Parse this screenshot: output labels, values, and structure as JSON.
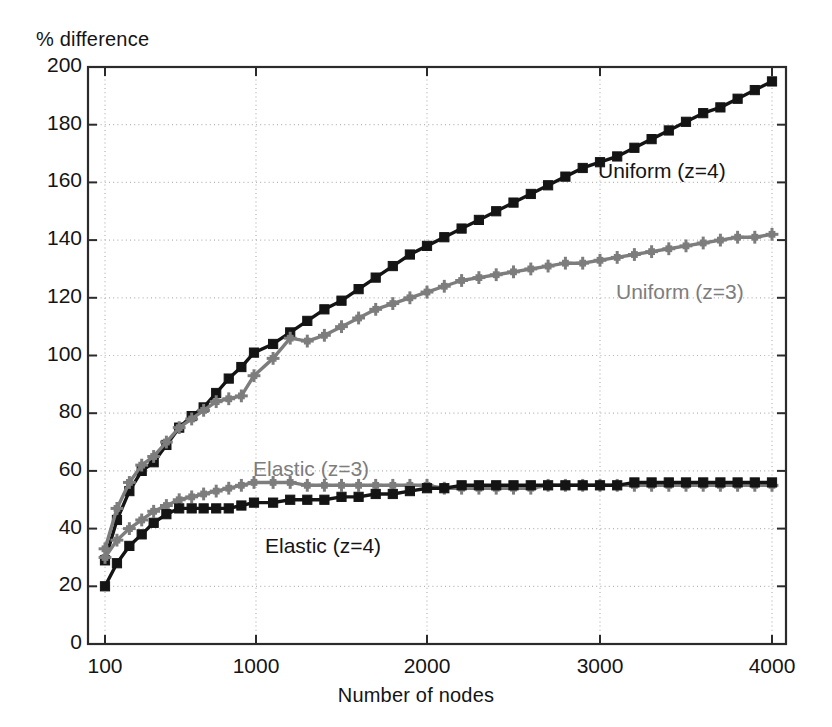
{
  "chart_data": {
    "type": "line",
    "title": "",
    "xlabel": "Number of nodes",
    "ylabel": "% difference",
    "xscale": "log-like",
    "xlim": [
      100,
      4000
    ],
    "ylim": [
      0,
      200
    ],
    "grid": true,
    "legend_position": "inline-annotations",
    "xticks": [
      100,
      1000,
      2000,
      3000,
      4000
    ],
    "xtick_labels": [
      "100",
      "1000",
      "2000",
      "3000",
      "4000"
    ],
    "yticks": [
      0,
      20,
      40,
      60,
      80,
      100,
      120,
      140,
      160,
      180,
      200
    ],
    "ytick_labels": [
      "0",
      "20",
      "40",
      "60",
      "80",
      "100",
      "120",
      "140",
      "160",
      "180",
      "200"
    ],
    "colors": {
      "black": "#141414",
      "gray": "#7d7d7d",
      "grid": "#b4b4b4",
      "axis": "#2b2b2b",
      "background": "#ffffff"
    },
    "series": [
      {
        "name": "Uniform (z=4)",
        "color": "#141414",
        "marker": "square",
        "x": [
          100,
          120,
          145,
          175,
          210,
          255,
          310,
          375,
          450,
          545,
          660,
          800,
          970,
          1100,
          1200,
          1300,
          1400,
          1500,
          1600,
          1700,
          1800,
          1900,
          2000,
          2100,
          2200,
          2300,
          2400,
          2500,
          2600,
          2700,
          2800,
          2900,
          3000,
          3100,
          3200,
          3300,
          3400,
          3500,
          3600,
          3700,
          3800,
          3900,
          4000
        ],
        "y": [
          29,
          43,
          53,
          60,
          63,
          69,
          75,
          79,
          82,
          87,
          92,
          96,
          101,
          104,
          108,
          112,
          116,
          119,
          123,
          127,
          131,
          135,
          138,
          141,
          144,
          147,
          150,
          153,
          156,
          159,
          162,
          165,
          167,
          169,
          172,
          175,
          178,
          181,
          184,
          186,
          189,
          192,
          195
        ]
      },
      {
        "name": "Uniform (z=3)",
        "color": "#7d7d7d",
        "marker": "plus-square",
        "x": [
          100,
          120,
          145,
          175,
          210,
          255,
          310,
          375,
          450,
          545,
          660,
          800,
          970,
          1100,
          1200,
          1300,
          1400,
          1500,
          1600,
          1700,
          1800,
          1900,
          2000,
          2100,
          2200,
          2300,
          2400,
          2500,
          2600,
          2700,
          2800,
          2900,
          3000,
          3100,
          3200,
          3300,
          3400,
          3500,
          3600,
          3700,
          3800,
          3900,
          4000
        ],
        "y": [
          33,
          47,
          56,
          62,
          65,
          70,
          75,
          78,
          81,
          84,
          85,
          86,
          93,
          99,
          106,
          105,
          107,
          110,
          113,
          116,
          118,
          120,
          122,
          124,
          126,
          127,
          128,
          129,
          130,
          131,
          132,
          132,
          133,
          134,
          135,
          136,
          137,
          138,
          139,
          140,
          141,
          141,
          142
        ]
      },
      {
        "name": "Elastic (z=3)",
        "color": "#7d7d7d",
        "marker": "plus-square",
        "x": [
          100,
          120,
          145,
          175,
          210,
          255,
          310,
          375,
          450,
          545,
          660,
          800,
          970,
          1100,
          1200,
          1300,
          1400,
          1500,
          1600,
          1700,
          1800,
          1900,
          2000,
          2100,
          2200,
          2300,
          2400,
          2500,
          2600,
          2700,
          2800,
          2900,
          3000,
          3100,
          3200,
          3300,
          3400,
          3500,
          3600,
          3700,
          3800,
          3900,
          4000
        ],
        "y": [
          30,
          36,
          40,
          43,
          46,
          48,
          50,
          51,
          52,
          53,
          54,
          55,
          56,
          56,
          56,
          55,
          55,
          55,
          55,
          55,
          55,
          55,
          55,
          54,
          54,
          54,
          54,
          54,
          54,
          55,
          55,
          55,
          55,
          55,
          55,
          55,
          55,
          55,
          55,
          55,
          55,
          55,
          55
        ]
      },
      {
        "name": "Elastic (z=4)",
        "color": "#141414",
        "marker": "square",
        "x": [
          100,
          120,
          145,
          175,
          210,
          255,
          310,
          375,
          450,
          545,
          660,
          800,
          970,
          1100,
          1200,
          1300,
          1400,
          1500,
          1600,
          1700,
          1800,
          1900,
          2000,
          2100,
          2200,
          2300,
          2400,
          2500,
          2600,
          2700,
          2800,
          2900,
          3000,
          3100,
          3200,
          3300,
          3400,
          3500,
          3600,
          3700,
          3800,
          3900,
          4000
        ],
        "y": [
          20,
          28,
          34,
          38,
          42,
          45,
          47,
          47,
          47,
          47,
          47,
          48,
          49,
          49,
          50,
          50,
          50,
          51,
          51,
          52,
          52,
          53,
          54,
          54,
          55,
          55,
          55,
          55,
          55,
          55,
          55,
          55,
          55,
          55,
          56,
          56,
          56,
          56,
          56,
          56,
          56,
          56,
          56
        ]
      }
    ],
    "annotations": [
      {
        "text": "Uniform (z=4)",
        "color": "#141414",
        "x_px": 598,
        "y_px": 159
      },
      {
        "text": "Uniform (z=3)",
        "color": "#7d7d7d",
        "x_px": 616,
        "y_px": 280
      },
      {
        "text": "Elastic (z=3)",
        "color": "#7d7d7d",
        "x_px": 253,
        "y_px": 457
      },
      {
        "text": "Elastic (z=4)",
        "color": "#141414",
        "x_px": 265,
        "y_px": 534
      }
    ]
  }
}
